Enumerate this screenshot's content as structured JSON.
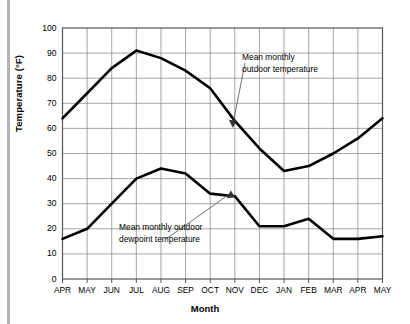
{
  "figure": {
    "accent_color": "#000000",
    "grid_color": "#808080",
    "frame_color": "#555555",
    "left_rule_color": "#b3b3b3"
  },
  "axes": {
    "y_title": "Temperature (°F)",
    "x_title": "Month",
    "y_ticks": [
      "0",
      "10",
      "20",
      "30",
      "40",
      "50",
      "60",
      "70",
      "80",
      "90",
      "100"
    ],
    "x_ticks": [
      "APR",
      "MAY",
      "JUN",
      "JUL",
      "AUG",
      "SEP",
      "OCT",
      "NOV",
      "DEC",
      "JAN",
      "FEB",
      "MAR",
      "APR",
      "MAY"
    ]
  },
  "annotations": {
    "temperature": {
      "line1": "Mean monthly",
      "line2": "outdoor temperature"
    },
    "dewpoint": {
      "line1": "Mean monthly outdoor",
      "line2": "dewpoint temperature"
    }
  },
  "chart_data": {
    "type": "line",
    "title": "",
    "xlabel": "Month",
    "ylabel": "Temperature (°F)",
    "ylim": [
      0,
      100
    ],
    "ytick_step": 10,
    "grid": true,
    "legend": "annotations",
    "categories": [
      "APR",
      "MAY",
      "JUN",
      "JUL",
      "AUG",
      "SEP",
      "OCT",
      "NOV",
      "DEC",
      "JAN",
      "FEB",
      "MAR",
      "APR",
      "MAY"
    ],
    "series": [
      {
        "name": "Mean monthly outdoor temperature",
        "values": [
          64,
          74,
          84,
          91,
          88,
          83,
          76,
          63,
          52,
          43,
          45,
          50,
          56,
          64
        ]
      },
      {
        "name": "Mean monthly outdoor dewpoint temperature",
        "values": [
          16,
          20,
          30,
          40,
          44,
          42,
          34,
          33,
          21,
          21,
          24,
          16,
          16,
          17
        ]
      }
    ],
    "annotations": [
      {
        "text": "Mean monthly outdoor temperature",
        "points_to_series": "Mean monthly outdoor temperature",
        "points_to_category": "NOV"
      },
      {
        "text": "Mean monthly outdoor dewpoint temperature",
        "points_to_series": "Mean monthly outdoor dewpoint temperature",
        "points_to_category": "NOV"
      }
    ]
  }
}
